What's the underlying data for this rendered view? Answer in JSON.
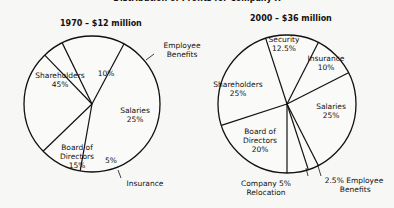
{
  "title": "Distribution of Profits for Company X",
  "chart_data": [
    {
      "type": "pie",
      "title": "1970 – $12 million",
      "categories": [
        "Shareholders",
        "Employee Benefits",
        "Salaries",
        "Insurance",
        "Board of Directors"
      ],
      "values": [
        45,
        10,
        25,
        5,
        15
      ],
      "unit": "%"
    },
    {
      "type": "pie",
      "title": "2000 – $36 million",
      "categories": [
        "Security",
        "Insurance",
        "Salaries",
        "Employee Benefits",
        "Company Relocation",
        "Board of Directors",
        "Shareholders"
      ],
      "values": [
        12.5,
        10,
        25,
        2.5,
        5,
        20,
        25
      ],
      "unit": "%"
    }
  ],
  "labels": {
    "left_title": "1970 – $12 million",
    "right_title": "2000 – $36 million"
  }
}
